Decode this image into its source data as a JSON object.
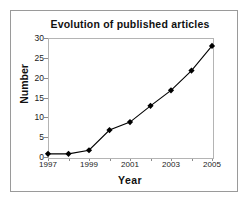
{
  "chart_data": {
    "type": "line",
    "title": "Evolution of published articles",
    "xlabel": "Year",
    "ylabel": "Number",
    "x": [
      1997,
      1998,
      1999,
      2000,
      2001,
      2002,
      2003,
      2004,
      2005
    ],
    "values": [
      0.8,
      0.8,
      1.7,
      6.8,
      8.8,
      12.9,
      16.8,
      21.8,
      28.0
    ],
    "xticklabels": [
      "1997",
      "1999",
      "2001",
      "2003",
      "2005"
    ],
    "xtickvalues": [
      1997,
      1999,
      2001,
      2003,
      2005
    ],
    "yticklabels": [
      "0",
      "5",
      "10",
      "15",
      "20",
      "25",
      "30"
    ],
    "ytickvalues": [
      0,
      5,
      10,
      15,
      20,
      25,
      30
    ],
    "xlim": [
      1997,
      2005
    ],
    "ylim": [
      0,
      30
    ],
    "grid": false,
    "legend": null,
    "marker": "diamond",
    "series_color": "#000000",
    "line_color": "#000000",
    "plot_border_color": "#b4b4b4",
    "frame_border_color": "#9a9a9a",
    "background": "#ffffff"
  }
}
